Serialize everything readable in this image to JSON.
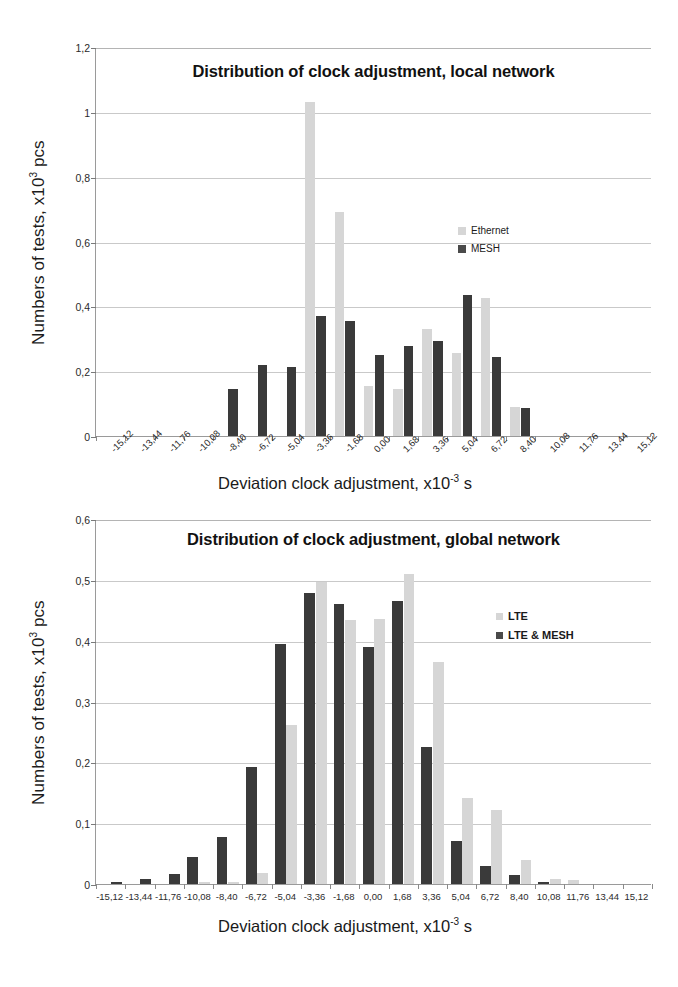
{
  "figure": {
    "background": "#ffffff",
    "series_colors": {
      "light": "#d6d6d6",
      "dark": "#3a3a3a"
    }
  },
  "chart_data": [
    {
      "id": "local-network",
      "type": "bar",
      "title": "Distribution of clock adjustment, local network",
      "xlabel_main": "Deviation clock adjustment, x10",
      "xlabel_sup": "-3",
      "xlabel_tail": " s",
      "ylabel_main": "Numbers of tests, x10",
      "ylabel_sup": "3",
      "ylabel_tail": " pcs",
      "ylim": [
        0,
        1.2
      ],
      "yticks": [
        0,
        0.2,
        0.4,
        0.6,
        0.8,
        1,
        1.2
      ],
      "ytick_labels": [
        "0",
        "0,2",
        "0,4",
        "0,6",
        "0,8",
        "1",
        "1,2"
      ],
      "grid": true,
      "legend_position": "inside-right",
      "categories": [
        "-15,12",
        "-13,44",
        "-11,76",
        "-10,08",
        "-8,40",
        "-6,72",
        "-5,04",
        "-3,36",
        "-1,68",
        "0,00",
        "1,68",
        "3,36",
        "5,04",
        "6,72",
        "8,40",
        "10,08",
        "11,76",
        "13,44",
        "15,12"
      ],
      "series": [
        {
          "name": "Ethernet",
          "color": "#d6d6d6",
          "values": [
            0,
            0,
            0,
            0,
            0,
            0,
            0,
            1.03,
            0.69,
            0.155,
            0.145,
            0.33,
            0.255,
            0.425,
            0.09,
            0,
            0,
            0,
            0
          ]
        },
        {
          "name": "MESH",
          "color": "#3a3a3a",
          "values": [
            0,
            0,
            0,
            0,
            0.145,
            0.22,
            0.212,
            0.37,
            0.355,
            0.25,
            0.278,
            0.293,
            0.435,
            0.243,
            0.085,
            0,
            0,
            0,
            0
          ]
        }
      ]
    },
    {
      "id": "global-network",
      "type": "bar",
      "title": "Distribution of clock adjustment, global network",
      "xlabel_main": "Deviation clock adjustment, x10",
      "xlabel_sup": "-3",
      "xlabel_tail": " s",
      "ylabel_main": "Numbers of tests, x10",
      "ylabel_sup": "3",
      "ylabel_tail": " pcs",
      "ylim": [
        0,
        0.6
      ],
      "yticks": [
        0,
        0.1,
        0.2,
        0.3,
        0.4,
        0.5,
        0.6
      ],
      "ytick_labels": [
        "0",
        "0,1",
        "0,2",
        "0,3",
        "0,4",
        "0,5",
        "0,6"
      ],
      "grid": true,
      "legend_position": "inside-right",
      "categories": [
        "-15,12",
        "-13,44",
        "-11,76",
        "-10,08",
        "-8,40",
        "-6,72",
        "-5,04",
        "-3,36",
        "-1,68",
        "0,00",
        "1,68",
        "3,36",
        "5,04",
        "6,72",
        "8,40",
        "10,08",
        "11,76",
        "13,44",
        "15,12"
      ],
      "series": [
        {
          "name": "LTE",
          "color": "#d6d6d6",
          "values": [
            0,
            0,
            0,
            0.003,
            0.004,
            0.018,
            0.262,
            0.497,
            0.434,
            0.435,
            0.51,
            0.365,
            0.142,
            0.122,
            0.04,
            0.008,
            0.006,
            0,
            0
          ]
        },
        {
          "name": "LTE & MESH",
          "color": "#3a3a3a",
          "values": [
            0.003,
            0.009,
            0.016,
            0.045,
            0.078,
            0.193,
            0.394,
            0.478,
            0.461,
            0.389,
            0.466,
            0.225,
            0.07,
            0.03,
            0.014,
            0.004,
            0,
            0,
            0
          ]
        }
      ]
    }
  ]
}
